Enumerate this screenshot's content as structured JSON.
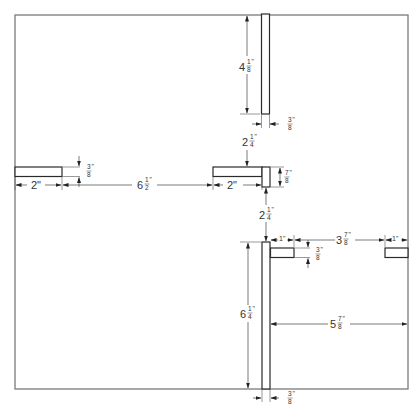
{
  "drawing": {
    "title": "Layout dimension drawing",
    "colors": {
      "frame": "#7a7a7a",
      "part": "#2a2a2a",
      "dimension": "#444444",
      "background": "#ffffff"
    },
    "dimensions": {
      "top_bar_length": {
        "whole": "4",
        "num": "1",
        "den": "8",
        "unit": "\""
      },
      "top_bar_width": {
        "whole": "",
        "num": "3",
        "den": "8",
        "unit": "\""
      },
      "gap_top_to_t": {
        "whole": "2",
        "num": "1",
        "den": "4",
        "unit": "\""
      },
      "t_flange_height": {
        "whole": "",
        "num": "7",
        "den": "8",
        "unit": "\""
      },
      "t_arm_length": {
        "whole": "2\"",
        "num": "",
        "den": "",
        "unit": ""
      },
      "left_bar_length": {
        "whole": "2\"",
        "num": "",
        "den": "",
        "unit": ""
      },
      "left_bar_thickness": {
        "whole": "",
        "num": "3",
        "den": "8",
        "unit": "\""
      },
      "gap_left_to_t": {
        "whole": "6",
        "num": "1",
        "den": "2",
        "unit": "\""
      },
      "gap_t_to_bottom": {
        "whole": "2",
        "num": "1",
        "den": "4",
        "unit": "\""
      },
      "tab_length": {
        "whole": "1\"",
        "num": "",
        "den": "",
        "unit": ""
      },
      "tab_thickness": {
        "whole": "",
        "num": "3",
        "den": "8",
        "unit": "\""
      },
      "gap_tab_to_right_tab": {
        "whole": "3",
        "num": "7",
        "den": "8",
        "unit": "\""
      },
      "right_tab_length": {
        "whole": "1\"",
        "num": "",
        "den": "",
        "unit": ""
      },
      "bottom_bar_length": {
        "whole": "6",
        "num": "1",
        "den": "4",
        "unit": "\""
      },
      "bottom_bar_to_right_edge": {
        "whole": "5",
        "num": "7",
        "den": "8",
        "unit": "\""
      },
      "bottom_bar_width": {
        "whole": "",
        "num": "3",
        "den": "8",
        "unit": "\""
      }
    }
  }
}
